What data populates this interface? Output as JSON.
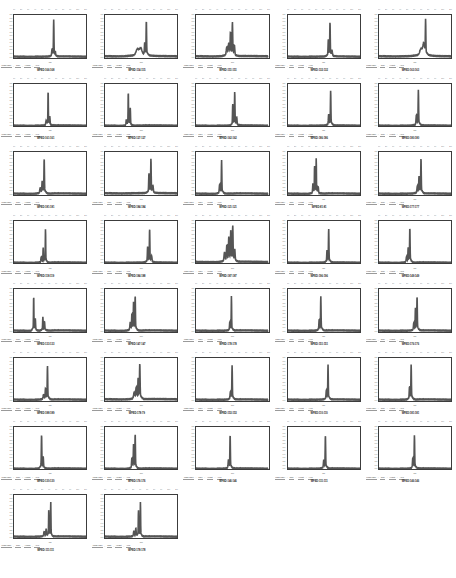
{
  "page": {
    "background": "#ffffff",
    "trace_color": "#555555",
    "axis_color": "#3c3c3c",
    "columns": 5,
    "rows": 8,
    "panel_count": 37
  },
  "axis": {
    "ylabel": "",
    "xlabel": "min",
    "yticks": [
      "1.20",
      "1.10",
      "1.00",
      "0.90",
      "0.80",
      "0.70",
      "0.60",
      "0.50",
      "0.40",
      "0.30",
      "0.20",
      "0.10",
      "0.00"
    ],
    "xticks": [
      "1.0",
      "2.0",
      "3.0",
      "4.0",
      "5.0",
      "6.0",
      "7.0",
      "8.0",
      "9.0",
      "10.0",
      "11.0"
    ]
  },
  "meta_strip": {
    "labels": [
      "Mass Label",
      "Time",
      "Height",
      "Area"
    ]
  },
  "chart_data": {
    "type": "line",
    "xlabel": "min",
    "ylabel": "Intensity",
    "xlim": [
      0,
      11
    ],
    "ylim": [
      0,
      1.25
    ],
    "grid": false,
    "legend": "none",
    "panels": [
      {
        "title": "WFED:166:168",
        "peaks": [
          [
            6.05,
            0.97,
            0.05
          ],
          [
            5.8,
            0.16,
            0.07
          ],
          [
            6.3,
            0.1,
            0.05
          ]
        ],
        "baseline": 0.03
      },
      {
        "title": "WFED:114:115",
        "peaks": [
          [
            6.3,
            0.92,
            0.05
          ],
          [
            6.05,
            0.3,
            0.06
          ],
          [
            4.95,
            0.18,
            0.3
          ],
          [
            5.45,
            0.2,
            0.25
          ]
        ],
        "baseline": 0.04
      },
      {
        "title": "WFED:151:151",
        "peaks": [
          [
            5.55,
            0.85,
            0.06
          ],
          [
            5.25,
            0.58,
            0.06
          ],
          [
            5.0,
            0.3,
            0.1
          ],
          [
            4.7,
            0.22,
            0.12
          ],
          [
            5.85,
            0.25,
            0.08
          ]
        ],
        "baseline": 0.04
      },
      {
        "title": "WFED:132:132",
        "peaks": [
          [
            6.4,
            0.9,
            0.05
          ],
          [
            6.15,
            0.42,
            0.06
          ],
          [
            6.7,
            0.14,
            0.09
          ]
        ],
        "baseline": 0.03
      },
      {
        "title": "WFED:163:163",
        "peaks": [
          [
            7.1,
            0.95,
            0.05
          ],
          [
            6.8,
            0.3,
            0.18
          ],
          [
            6.4,
            0.18,
            0.25
          ]
        ],
        "baseline": 0.04
      },
      {
        "title": "WFED:161:161",
        "peaks": [
          [
            5.2,
            0.93,
            0.04
          ],
          [
            5.45,
            0.22,
            0.06
          ],
          [
            4.9,
            0.12,
            0.08
          ]
        ],
        "baseline": 0.03
      },
      {
        "title": "WFED:127:127",
        "peaks": [
          [
            3.55,
            0.9,
            0.04
          ],
          [
            3.85,
            0.45,
            0.05
          ],
          [
            3.25,
            0.15,
            0.06
          ]
        ],
        "baseline": 0.03
      },
      {
        "title": "WFED:162:162",
        "peaks": [
          [
            5.9,
            0.88,
            0.05
          ],
          [
            5.6,
            0.55,
            0.05
          ],
          [
            6.2,
            0.2,
            0.07
          ]
        ],
        "baseline": 0.03
      },
      {
        "title": "WFED:186:186",
        "peaks": [
          [
            6.5,
            0.92,
            0.05
          ],
          [
            6.2,
            0.28,
            0.07
          ]
        ],
        "baseline": 0.03
      },
      {
        "title": "WFED:180:180",
        "peaks": [
          [
            6.0,
            0.94,
            0.05
          ],
          [
            5.7,
            0.25,
            0.08
          ]
        ],
        "baseline": 0.03
      },
      {
        "title": "WFED:181:181",
        "peaks": [
          [
            4.6,
            0.92,
            0.05
          ],
          [
            4.3,
            0.3,
            0.07
          ],
          [
            4.0,
            0.14,
            0.1
          ]
        ],
        "baseline": 0.03
      },
      {
        "title": "WFED:184:184",
        "peaks": [
          [
            7.0,
            0.9,
            0.05
          ],
          [
            6.7,
            0.5,
            0.06
          ],
          [
            7.3,
            0.18,
            0.08
          ]
        ],
        "baseline": 0.04
      },
      {
        "title": "WFED:121:121",
        "peaks": [
          [
            3.9,
            0.88,
            0.05
          ],
          [
            3.6,
            0.22,
            0.07
          ]
        ],
        "baseline": 0.03
      },
      {
        "title": "WFED:81:81",
        "peaks": [
          [
            4.3,
            0.92,
            0.04
          ],
          [
            4.05,
            0.72,
            0.04
          ],
          [
            3.8,
            0.25,
            0.06
          ],
          [
            4.6,
            0.16,
            0.07
          ]
        ],
        "baseline": 0.03
      },
      {
        "title": "WFED:177:177",
        "peaks": [
          [
            6.4,
            0.93,
            0.05
          ],
          [
            6.1,
            0.42,
            0.06
          ],
          [
            5.85,
            0.18,
            0.09
          ]
        ],
        "baseline": 0.03
      },
      {
        "title": "WFED:118:119",
        "peaks": [
          [
            4.8,
            0.9,
            0.04
          ],
          [
            4.45,
            0.38,
            0.05
          ],
          [
            4.15,
            0.14,
            0.07
          ]
        ],
        "baseline": 0.03
      },
      {
        "title": "WFED:184:188",
        "peaks": [
          [
            6.8,
            0.88,
            0.05
          ],
          [
            6.5,
            0.4,
            0.06
          ],
          [
            7.1,
            0.15,
            0.08
          ]
        ],
        "baseline": 0.03
      },
      {
        "title": "WFED:187:187",
        "peaks": [
          [
            5.6,
            0.92,
            0.06
          ],
          [
            5.3,
            0.78,
            0.06
          ],
          [
            5.0,
            0.6,
            0.07
          ],
          [
            4.7,
            0.4,
            0.08
          ],
          [
            4.35,
            0.24,
            0.1
          ],
          [
            5.9,
            0.3,
            0.08
          ]
        ],
        "baseline": 0.05
      },
      {
        "title": "WFED:196:196",
        "peaks": [
          [
            6.2,
            0.9,
            0.05
          ],
          [
            5.95,
            0.3,
            0.06
          ]
        ],
        "baseline": 0.03
      },
      {
        "title": "WFED:149:149",
        "peaks": [
          [
            4.7,
            0.92,
            0.05
          ],
          [
            4.45,
            0.35,
            0.06
          ],
          [
            4.2,
            0.14,
            0.08
          ]
        ],
        "baseline": 0.03
      },
      {
        "title": "WFED:133:133",
        "peaks": [
          [
            3.0,
            0.93,
            0.04
          ],
          [
            3.25,
            0.3,
            0.05
          ],
          [
            4.4,
            0.35,
            0.05
          ],
          [
            4.65,
            0.22,
            0.06
          ]
        ],
        "baseline": 0.03
      },
      {
        "title": "WFED:147:147",
        "peaks": [
          [
            4.6,
            0.9,
            0.05
          ],
          [
            4.35,
            0.7,
            0.05
          ],
          [
            4.1,
            0.4,
            0.06
          ],
          [
            3.85,
            0.2,
            0.08
          ]
        ],
        "baseline": 0.03
      },
      {
        "title": "WFED:178:178",
        "peaks": [
          [
            5.4,
            0.92,
            0.04
          ],
          [
            5.15,
            0.2,
            0.06
          ]
        ],
        "baseline": 0.03
      },
      {
        "title": "WFED:151:151",
        "peaks": [
          [
            5.0,
            0.9,
            0.05
          ],
          [
            4.75,
            0.26,
            0.06
          ]
        ],
        "baseline": 0.03
      },
      {
        "title": "WFED:176:176",
        "peaks": [
          [
            5.8,
            0.9,
            0.05
          ],
          [
            5.55,
            0.55,
            0.05
          ],
          [
            5.3,
            0.18,
            0.07
          ]
        ],
        "baseline": 0.03
      },
      {
        "title": "WFED:188:189",
        "peaks": [
          [
            5.1,
            0.9,
            0.05
          ],
          [
            4.8,
            0.26,
            0.07
          ],
          [
            4.5,
            0.12,
            0.09
          ]
        ],
        "baseline": 0.03
      },
      {
        "title": "WFED:178:79",
        "peaks": [
          [
            5.3,
            0.92,
            0.06
          ],
          [
            5.05,
            0.5,
            0.06
          ],
          [
            4.75,
            0.28,
            0.09
          ],
          [
            4.45,
            0.16,
            0.12
          ]
        ],
        "baseline": 0.04
      },
      {
        "title": "WFED:153:153",
        "peaks": [
          [
            5.5,
            0.9,
            0.05
          ],
          [
            5.25,
            0.18,
            0.07
          ]
        ],
        "baseline": 0.03
      },
      {
        "title": "WFED:110:110",
        "peaks": [
          [
            6.1,
            0.92,
            0.05
          ],
          [
            5.85,
            0.22,
            0.07
          ]
        ],
        "baseline": 0.03
      },
      {
        "title": "WFED:181:181",
        "peaks": [
          [
            4.9,
            0.92,
            0.05
          ],
          [
            4.65,
            0.3,
            0.06
          ]
        ],
        "baseline": 0.03
      },
      {
        "title": "WFED:130:130",
        "peaks": [
          [
            4.2,
            0.9,
            0.05
          ],
          [
            4.45,
            0.28,
            0.06
          ]
        ],
        "baseline": 0.03
      },
      {
        "title": "WFED:176:176",
        "peaks": [
          [
            4.6,
            0.9,
            0.05
          ],
          [
            4.35,
            0.6,
            0.05
          ],
          [
            4.1,
            0.25,
            0.07
          ]
        ],
        "baseline": 0.03
      },
      {
        "title": "WFED:146:146",
        "peaks": [
          [
            5.2,
            0.9,
            0.05
          ],
          [
            4.95,
            0.2,
            0.07
          ]
        ],
        "baseline": 0.03
      },
      {
        "title": "WFED:111:111",
        "peaks": [
          [
            5.7,
            0.88,
            0.05
          ],
          [
            5.45,
            0.2,
            0.07
          ]
        ],
        "baseline": 0.03
      },
      {
        "title": "WFED:146:146",
        "peaks": [
          [
            5.4,
            0.88,
            0.05
          ],
          [
            5.15,
            0.24,
            0.07
          ]
        ],
        "baseline": 0.03
      },
      {
        "title": "WFED:111:111",
        "peaks": [
          [
            5.6,
            0.92,
            0.04
          ],
          [
            5.3,
            0.72,
            0.04
          ],
          [
            4.9,
            0.2,
            0.07
          ],
          [
            4.6,
            0.12,
            0.09
          ]
        ],
        "baseline": 0.03
      },
      {
        "title": "WFED:178:178",
        "peaks": [
          [
            5.4,
            0.92,
            0.04
          ],
          [
            5.1,
            0.7,
            0.04
          ],
          [
            4.7,
            0.22,
            0.06
          ],
          [
            4.4,
            0.14,
            0.08
          ]
        ],
        "baseline": 0.03
      }
    ]
  }
}
